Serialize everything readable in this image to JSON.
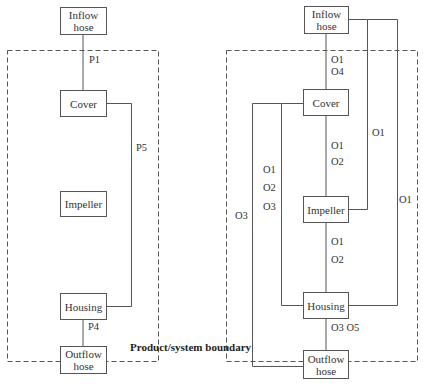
{
  "boundary_label": "Product/system boundary",
  "left_diagram": {
    "boxes": {
      "inflow": "Inflow hose",
      "inflow_line1": "Inflow",
      "inflow_line2": "hose",
      "cover": "Cover",
      "impeller": "Impeller",
      "housing": "Housing",
      "outflow_line1": "Outflow",
      "outflow_line2": "hose"
    },
    "flows": {
      "p1": "P1",
      "p5": "P5",
      "p4": "P4"
    }
  },
  "right_diagram": {
    "boxes": {
      "inflow_line1": "Inflow",
      "inflow_line2": "hose",
      "cover": "Cover",
      "impeller": "Impeller",
      "housing": "Housing",
      "outflow_line1": "Outflow",
      "outflow_line2": "hose"
    },
    "flows": {
      "inflow_cover_a": "O1",
      "inflow_cover_b": "O4",
      "cover_impeller_a": "O1",
      "cover_impeller_b": "O2",
      "inflow_impeller": "O1",
      "cover_housing_a": "O1",
      "cover_housing_b": "O2",
      "cover_housing_c": "O3",
      "cover_outflow": "O3",
      "impeller_housing_a": "O1",
      "impeller_housing_b": "O2",
      "inflow_housing": "O1",
      "housing_outflow": "O3 O5"
    }
  },
  "colors": {
    "line": "#555555",
    "dash": "#555555",
    "text": "#333333"
  }
}
